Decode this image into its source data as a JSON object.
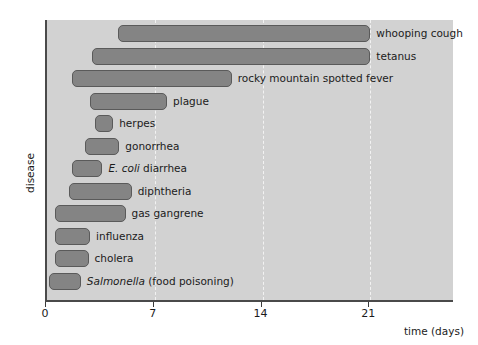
{
  "chart_data": {
    "type": "bar",
    "orientation": "horizontal",
    "title": "",
    "xlabel": "time (days)",
    "ylabel": "disease",
    "xlim": [
      0,
      26.5
    ],
    "xticks": [
      0,
      7,
      14,
      21
    ],
    "xtick_labels": [
      "0",
      "7",
      "14",
      "21"
    ],
    "grid": "vertical-dashed",
    "legend": "none",
    "bar_style": "range-bars",
    "categories": [
      "whooping cough",
      "tetanus",
      "rocky mountain spotted fever",
      "plague",
      "herpes",
      "gonorrhea",
      "E. coli diarrhea",
      "diphtheria",
      "gas gangrene",
      "influenza",
      "cholera",
      "Salmonella (food poisoning)"
    ],
    "bars": [
      {
        "label": "whooping cough",
        "start": 4.6,
        "end": 21.0,
        "italic_prefix": ""
      },
      {
        "label": "tetanus",
        "start": 2.9,
        "end": 21.0,
        "italic_prefix": ""
      },
      {
        "label": "rocky mountain spotted fever",
        "start": 1.6,
        "end": 12.0,
        "italic_prefix": ""
      },
      {
        "label": "plague",
        "start": 2.8,
        "end": 7.8,
        "italic_prefix": ""
      },
      {
        "label": "herpes",
        "start": 3.1,
        "end": 4.3,
        "italic_prefix": ""
      },
      {
        "label": "gonorrhea",
        "start": 2.5,
        "end": 4.7,
        "italic_prefix": ""
      },
      {
        "label": " diarrhea",
        "start": 1.6,
        "end": 3.6,
        "italic_prefix": "E. coli"
      },
      {
        "label": "diphtheria",
        "start": 1.4,
        "end": 5.5,
        "italic_prefix": ""
      },
      {
        "label": "gas gangrene",
        "start": 0.5,
        "end": 5.1,
        "italic_prefix": ""
      },
      {
        "label": "influenza",
        "start": 0.5,
        "end": 2.8,
        "italic_prefix": ""
      },
      {
        "label": "cholera",
        "start": 0.5,
        "end": 2.7,
        "italic_prefix": ""
      },
      {
        "label": " (food poisoning)",
        "start": 0.1,
        "end": 2.2,
        "italic_prefix": "Salmonella"
      }
    ],
    "colors": {
      "plot_background": "#d2d2d2",
      "bar_fill": "#848484",
      "bar_stroke": "#5a5a5a",
      "axis": "#4a4a4a",
      "gridline": "#f2f2f2",
      "text": "#1b1b1b",
      "page_background": "#ffffff"
    }
  }
}
